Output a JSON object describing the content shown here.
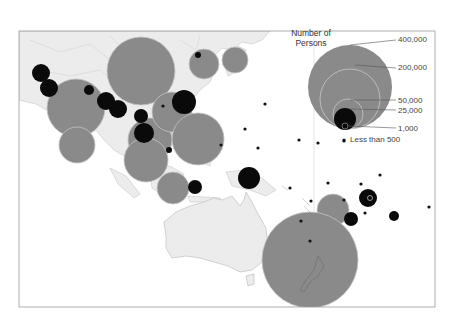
{
  "legend": {
    "title_line1": "Number of",
    "title_line2": "Persons",
    "labels": [
      {
        "text": "400,000",
        "y": 40
      },
      {
        "text": "200,000",
        "y": 68
      },
      {
        "text": "50,000",
        "y": 101
      },
      {
        "text": "25,000",
        "y": 111
      },
      {
        "text": "1,000",
        "y": 129
      },
      {
        "text": "Less than 500",
        "y": 140
      }
    ]
  },
  "colors": {
    "land": "#ececec",
    "land_stroke": "#c8c8c8",
    "bubble_large": "#8a8a8a",
    "bubble_small": "#0a0a0a",
    "frame": "#9a9a9a"
  },
  "chart_data": {
    "type": "proportional-symbol-map",
    "title": "Number of Persons",
    "legend_sizes": [
      "400,000",
      "200,000",
      "50,000",
      "25,000",
      "1,000",
      "Less than 500"
    ],
    "gray_bubbles": [
      {
        "x": 141,
        "y": 71,
        "r": 34
      },
      {
        "x": 76,
        "y": 108,
        "r": 29
      },
      {
        "x": 77,
        "y": 145,
        "r": 18
      },
      {
        "x": 150,
        "y": 140,
        "r": 22
      },
      {
        "x": 172,
        "y": 112,
        "r": 20
      },
      {
        "x": 198,
        "y": 139,
        "r": 26
      },
      {
        "x": 146,
        "y": 160,
        "r": 22
      },
      {
        "x": 173,
        "y": 188,
        "r": 16
      },
      {
        "x": 204,
        "y": 64,
        "r": 15
      },
      {
        "x": 235,
        "y": 60,
        "r": 13
      },
      {
        "x": 333,
        "y": 210,
        "r": 16
      },
      {
        "x": 310,
        "y": 260,
        "r": 48
      }
    ],
    "black_bubbles": [
      {
        "x": 41,
        "y": 73,
        "r": 9
      },
      {
        "x": 49,
        "y": 88,
        "r": 9
      },
      {
        "x": 89,
        "y": 90,
        "r": 5
      },
      {
        "x": 106,
        "y": 101,
        "r": 9
      },
      {
        "x": 118,
        "y": 109,
        "r": 9
      },
      {
        "x": 141,
        "y": 116,
        "r": 7
      },
      {
        "x": 144,
        "y": 133,
        "r": 10
      },
      {
        "x": 184,
        "y": 102,
        "r": 12
      },
      {
        "x": 249,
        "y": 178,
        "r": 11
      },
      {
        "x": 195,
        "y": 187,
        "r": 7
      },
      {
        "x": 169,
        "y": 150,
        "r": 3
      },
      {
        "x": 368,
        "y": 198,
        "r": 9
      },
      {
        "x": 351,
        "y": 219,
        "r": 7
      },
      {
        "x": 394,
        "y": 216,
        "r": 5
      },
      {
        "x": 198,
        "y": 55,
        "r": 3
      }
    ],
    "small_dots": [
      {
        "x": 163,
        "y": 106
      },
      {
        "x": 221,
        "y": 145
      },
      {
        "x": 265,
        "y": 104
      },
      {
        "x": 245,
        "y": 129
      },
      {
        "x": 258,
        "y": 148
      },
      {
        "x": 318,
        "y": 143
      },
      {
        "x": 344,
        "y": 141
      },
      {
        "x": 290,
        "y": 188
      },
      {
        "x": 328,
        "y": 183
      },
      {
        "x": 361,
        "y": 184
      },
      {
        "x": 380,
        "y": 175
      },
      {
        "x": 311,
        "y": 201
      },
      {
        "x": 344,
        "y": 200
      },
      {
        "x": 365,
        "y": 213
      },
      {
        "x": 429,
        "y": 207
      },
      {
        "x": 301,
        "y": 221
      },
      {
        "x": 310,
        "y": 241
      },
      {
        "x": 299,
        "y": 140
      }
    ]
  }
}
